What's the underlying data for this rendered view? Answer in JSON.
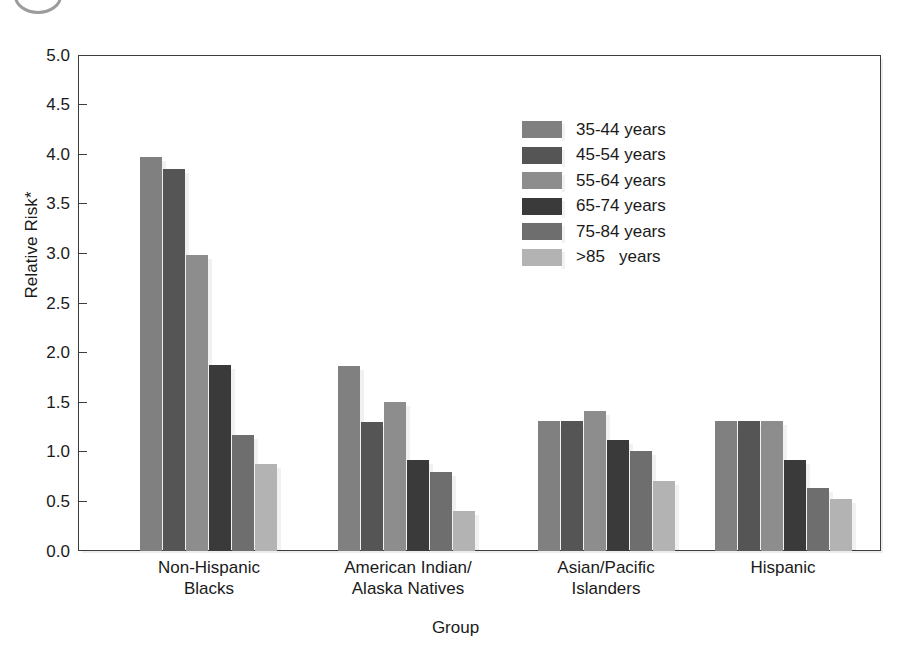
{
  "figure": {
    "corner_mark": "cropped-circle-mark"
  },
  "chart_data": {
    "type": "bar",
    "title": "",
    "xlabel": "Group",
    "ylabel": "Relative Risk*",
    "ylim": [
      0.0,
      5.0
    ],
    "ytick_labels": [
      "0.0",
      "0.5",
      "1.0",
      "1.5",
      "2.0",
      "2.5",
      "3.0",
      "3.5",
      "4.0",
      "4.5",
      "5.0"
    ],
    "ytick_values": [
      0.0,
      0.5,
      1.0,
      1.5,
      2.0,
      2.5,
      3.0,
      3.5,
      4.0,
      4.5,
      5.0
    ],
    "grid": false,
    "legend_position": "upper-center-right",
    "categories": [
      "Non-Hispanic\nBlacks",
      "American Indian/\nAlaska Natives",
      "Asian/Pacific\nIslanders",
      "Hispanic"
    ],
    "category_lines": [
      [
        "Non-Hispanic",
        "Blacks"
      ],
      [
        "American Indian/",
        "Alaska Natives"
      ],
      [
        "Asian/Pacific",
        "Islanders"
      ],
      [
        "Hispanic",
        ""
      ]
    ],
    "series": [
      {
        "name": "35-44 years",
        "label": "35-44 years",
        "color": "#808080",
        "values": [
          3.97,
          1.87,
          1.31,
          1.31
        ]
      },
      {
        "name": "45-54 years",
        "label": "45-54 years",
        "color": "#555555",
        "values": [
          3.85,
          1.3,
          1.31,
          1.31
        ]
      },
      {
        "name": "55-64 years",
        "label": "55-64 years",
        "color": "#8d8d8d",
        "values": [
          2.98,
          1.5,
          1.41,
          1.31
        ]
      },
      {
        "name": "65-74 years",
        "label": "65-74 years",
        "color": "#3a3a3a",
        "values": [
          1.88,
          0.92,
          1.12,
          0.92
        ]
      },
      {
        "name": "75-84 years",
        "label": "75-84 years",
        "color": "#6e6e6e",
        "values": [
          1.17,
          0.8,
          1.01,
          0.64
        ]
      },
      {
        "name": ">85   years",
        "label": ">85   years",
        "color": "#b3b3b3",
        "values": [
          0.88,
          0.4,
          0.71,
          0.52
        ]
      }
    ]
  }
}
